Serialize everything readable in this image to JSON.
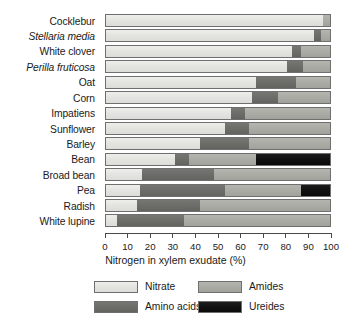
{
  "chart_data": {
    "type": "bar",
    "orientation": "horizontal",
    "stacked": true,
    "title": "",
    "xlabel": "Nitrogen in xylem exudate (%)",
    "ylabel": "",
    "xlim": [
      0,
      100
    ],
    "xticks": [
      0,
      10,
      20,
      30,
      40,
      50,
      60,
      70,
      80,
      90,
      100
    ],
    "xticklabels": [
      "0",
      "10",
      "20",
      "30",
      "40",
      "50",
      "60",
      "70",
      "80",
      "90",
      "100"
    ],
    "grid": false,
    "legend_position": "below-axis",
    "categories": [
      "Cocklebur",
      "Stellaria media",
      "White clover",
      "Perilla fruticosa",
      "Oat",
      "Corn",
      "Impatiens",
      "Sunflower",
      "Barley",
      "Bean",
      "Broad bean",
      "Pea",
      "Radish",
      "White lupine"
    ],
    "category_styles": [
      "normal",
      "italic",
      "normal",
      "italic",
      "normal",
      "normal",
      "normal",
      "normal",
      "normal",
      "normal",
      "normal",
      "normal",
      "normal",
      "normal"
    ],
    "series": [
      {
        "name": "Nitrate",
        "color": "#e4e4e0",
        "values": [
          97,
          93,
          83,
          81,
          67,
          65,
          56,
          53,
          42,
          31,
          16,
          15,
          14,
          5
        ]
      },
      {
        "name": "Amino acids",
        "color": "#6d6d69",
        "values": [
          0,
          3,
          4,
          7,
          18,
          12,
          6,
          11,
          22,
          6,
          32,
          38,
          28,
          30
        ]
      },
      {
        "name": "Amides",
        "color": "#acaca7",
        "values": [
          3,
          4,
          13,
          12,
          15,
          23,
          38,
          36,
          36,
          30,
          52,
          34,
          58,
          65
        ]
      },
      {
        "name": "Ureides",
        "color": "#121212",
        "values": [
          0,
          0,
          0,
          0,
          0,
          0,
          0,
          0,
          0,
          33,
          0,
          13,
          0,
          0
        ]
      }
    ]
  },
  "legend": {
    "items": [
      {
        "label": "Nitrate",
        "key": "nitrate"
      },
      {
        "label": "Amides",
        "key": "amides"
      },
      {
        "label": "Amino acids",
        "key": "amino"
      },
      {
        "label": "Ureides",
        "key": "ureides"
      }
    ]
  }
}
